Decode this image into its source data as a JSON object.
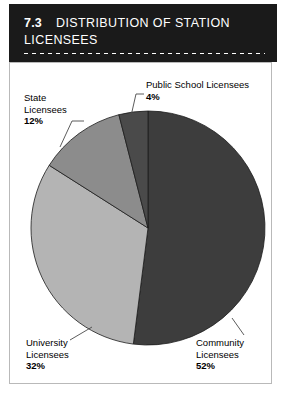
{
  "header": {
    "section_number": "7.3",
    "title_line1": "DISTRIBUTION OF STATION",
    "title_line2": "LICENSEES",
    "background_color": "#1a1a1a",
    "text_color": "#ffffff"
  },
  "chart_data": {
    "type": "pie",
    "title": "DISTRIBUTION OF STATION LICENSEES",
    "subtitle": "",
    "xlabel": "",
    "ylabel": "",
    "grid": false,
    "legend_position": "callout-labels",
    "start_angle_deg": 0,
    "direction": "clockwise",
    "categories": [
      "Community Licensees",
      "University Licensees",
      "State Licensees",
      "Public School Licensees"
    ],
    "values": [
      52,
      32,
      12,
      4
    ],
    "value_labels": [
      "52%",
      "32%",
      "12%",
      "4%"
    ],
    "unit": "%",
    "colors": [
      "#3d3d3d",
      "#b4b4b4",
      "#8c8c8c",
      "#4a4a4a"
    ],
    "slices": [
      {
        "label_line1": "Community",
        "label_line2": "Licensees",
        "percent_text": "52%",
        "value": 52,
        "color": "#3d3d3d"
      },
      {
        "label_line1": "University",
        "label_line2": "Licensees",
        "percent_text": "32%",
        "value": 32,
        "color": "#b4b4b4"
      },
      {
        "label_line1": "State",
        "label_line2": "Licensees",
        "percent_text": "12%",
        "value": 12,
        "color": "#8c8c8c"
      },
      {
        "label_line1": "Public School Licensees",
        "label_line2": "",
        "percent_text": "4%",
        "value": 4,
        "color": "#4a4a4a"
      }
    ]
  },
  "frame": {
    "border_color": "#b9b9b9",
    "background_color": "#ffffff"
  }
}
